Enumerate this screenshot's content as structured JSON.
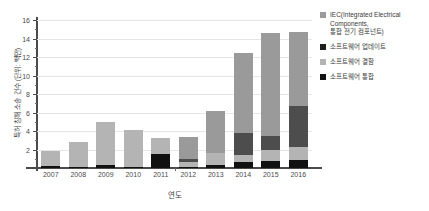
{
  "chart_data": {
    "type": "bar",
    "subtype": "stacked-bar",
    "title": "",
    "xlabel": "연도",
    "ylabel": "특허 침해 소송 건수 (단위: 백만)",
    "ylim": [
      0,
      16
    ],
    "yticks": [
      0,
      2,
      4,
      6,
      8,
      10,
      12,
      14,
      16
    ],
    "ytick_labels": [
      "",
      "2",
      "4",
      "6",
      "8",
      "10",
      "12",
      "14",
      "16"
    ],
    "grid": true,
    "grid_axis": "y",
    "legend_position": "right",
    "categories": [
      "2007",
      "2008",
      "2009",
      "2010",
      "2011",
      "2012",
      "2013",
      "2014",
      "2015",
      "2016"
    ],
    "series": [
      {
        "name": "소프트웨어 통합",
        "color": "#111111",
        "values": [
          0.25,
          0.12,
          0.3,
          0.15,
          1.5,
          0.12,
          0.35,
          0.6,
          0.75,
          0.9
        ]
      },
      {
        "name": "소프트웨어 결함",
        "color": "#b4b4b4",
        "values": [
          1.55,
          2.68,
          4.7,
          3.95,
          1.7,
          0.55,
          1.25,
          0.85,
          1.15,
          1.35
        ]
      },
      {
        "name": "소프트웨어 업데이트",
        "color": "#4d4d4d",
        "values": [
          0.0,
          0.0,
          0.0,
          0.0,
          0.0,
          0.35,
          0.0,
          2.35,
          1.55,
          4.5
        ]
      },
      {
        "name": "IEC(Integrated Electrical\nComponents,\n통합 전기 컴포넌트)",
        "color": "#9a9a9a",
        "values": [
          0.0,
          0.0,
          0.0,
          0.0,
          0.0,
          2.3,
          4.6,
          8.6,
          11.1,
          7.95
        ]
      }
    ],
    "totals": [
      1.8,
      2.8,
      5.0,
      4.1,
      3.2,
      3.3,
      6.2,
      12.4,
      14.55,
      14.7
    ]
  },
  "legend": {
    "items": [
      {
        "label": "IEC(Integrated Electrical\nComponents,\n통합 전기 컴포넌트)",
        "color": "#9a9a9a"
      },
      {
        "label": "소프트웨어 업데이트",
        "color": "#1f1f1f"
      },
      {
        "label": "소프트웨어 결함",
        "color": "#b4b4b4"
      },
      {
        "label": "소프트웨어 통합",
        "color": "#111111"
      }
    ]
  },
  "axes": {
    "y_title": "특허 침해 소송 건수 (단위: 백만)",
    "x_title": "연도"
  }
}
